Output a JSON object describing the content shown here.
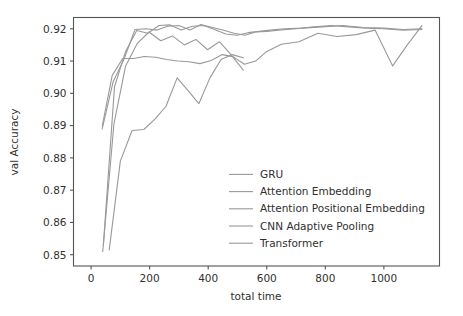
{
  "chart_data": {
    "type": "line",
    "title": "",
    "xlabel": "total time",
    "ylabel": "val Accuracy",
    "xlim": [
      -60,
      1190
    ],
    "ylim": [
      0.8465,
      0.9235
    ],
    "grid": false,
    "legend_position": "lower right",
    "xticks": [
      0,
      200,
      400,
      600,
      800,
      1000
    ],
    "xtick_labels": [
      "0",
      "200",
      "400",
      "600",
      "800",
      "1000"
    ],
    "yticks": [
      0.85,
      0.86,
      0.87,
      0.88,
      0.89,
      0.9,
      0.91,
      0.92
    ],
    "ytick_labels": [
      "0.85",
      "0.86",
      "0.87",
      "0.88",
      "0.89",
      "0.90",
      "0.91",
      "0.92"
    ],
    "line_color": "#999999",
    "series": [
      {
        "name": "GRU",
        "x": [
          40,
          78,
          118,
          158,
          198,
          238,
          278,
          318,
          358,
          398,
          438,
          478,
          520
        ],
        "y": [
          0.851,
          0.8905,
          0.9085,
          0.9155,
          0.919,
          0.9163,
          0.9178,
          0.915,
          0.9167,
          0.9135,
          0.916,
          0.912,
          0.9072
        ]
      },
      {
        "name": "Attention Embedding",
        "x": [
          38,
          75,
          112,
          150,
          188,
          225,
          262,
          300,
          338,
          375,
          412,
          450,
          488,
          525,
          562,
          600,
          640,
          700,
          760,
          820,
          880,
          940,
          1000,
          1065,
          1130
        ],
        "y": [
          0.889,
          0.9035,
          0.9105,
          0.9198,
          0.92,
          0.9196,
          0.9208,
          0.921,
          0.9196,
          0.9213,
          0.9205,
          0.9196,
          0.9186,
          0.918,
          0.919,
          0.9192,
          0.9196,
          0.92,
          0.9206,
          0.921,
          0.9206,
          0.9202,
          0.92,
          0.9196,
          0.9198
        ]
      },
      {
        "name": "Attention Positional Embedding",
        "x": [
          42,
          80,
          118,
          156,
          194,
          232,
          270,
          308,
          346,
          384,
          422,
          460,
          498,
          536,
          574,
          612,
          660,
          720,
          790,
          860,
          930,
          1000,
          1065,
          1130
        ],
        "y": [
          0.853,
          0.902,
          0.913,
          0.9195,
          0.9186,
          0.921,
          0.9212,
          0.9196,
          0.9208,
          0.921,
          0.9198,
          0.9184,
          0.918,
          0.9188,
          0.9192,
          0.9196,
          0.92,
          0.9202,
          0.9206,
          0.921,
          0.9204,
          0.9202,
          0.9198,
          0.92
        ]
      },
      {
        "name": "CNN Adaptive Pooling",
        "x": [
          38,
          72,
          108,
          145,
          182,
          220,
          258,
          296,
          334,
          372,
          410,
          448,
          486,
          524,
          562,
          600,
          650,
          710,
          775,
          840,
          905,
          970,
          1030,
          1080,
          1130
        ],
        "y": [
          0.8898,
          0.9055,
          0.9108,
          0.9108,
          0.9114,
          0.9112,
          0.9105,
          0.91,
          0.9098,
          0.9092,
          0.9102,
          0.912,
          0.9113,
          0.909,
          0.91,
          0.913,
          0.9152,
          0.916,
          0.9186,
          0.9176,
          0.9182,
          0.9196,
          0.9085,
          0.915,
          0.921
        ]
      },
      {
        "name": "Transformer",
        "x": [
          62,
          100,
          140,
          180,
          218,
          256,
          294,
          330,
          368,
          406,
          444,
          482,
          520
        ],
        "y": [
          0.8515,
          0.879,
          0.8885,
          0.8888,
          0.892,
          0.896,
          0.9048,
          0.901,
          0.8968,
          0.9048,
          0.9105,
          0.912,
          0.911
        ]
      }
    ]
  },
  "legend": {
    "items": [
      {
        "label": "GRU"
      },
      {
        "label": "Attention Embedding"
      },
      {
        "label": "Attention Positional Embedding"
      },
      {
        "label": "CNN Adaptive Pooling"
      },
      {
        "label": "Transformer"
      }
    ]
  }
}
